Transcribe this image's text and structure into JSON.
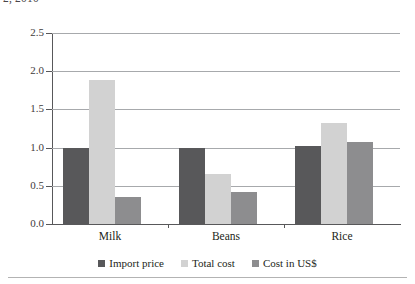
{
  "caption": {
    "text": "2, 2010"
  },
  "chart_data": {
    "type": "bar",
    "title": "",
    "xlabel": "",
    "ylabel": "",
    "ylim": [
      0.0,
      2.5
    ],
    "yticks": [
      "0.0",
      "0.5",
      "1.0",
      "1.5",
      "2.0",
      "2.5"
    ],
    "ytick_values": [
      0.0,
      0.5,
      1.0,
      1.5,
      2.0,
      2.5
    ],
    "grid": true,
    "legend_position": "bottom",
    "categories": [
      "Milk",
      "Beans",
      "Rice"
    ],
    "series": [
      {
        "name": "Import price",
        "color": "#58585a",
        "values": [
          1.0,
          1.0,
          1.02
        ]
      },
      {
        "name": "Total cost",
        "color": "#d2d2d2",
        "values": [
          1.89,
          0.65,
          1.32
        ]
      },
      {
        "name": "Cost in US$",
        "color": "#8d8d8f",
        "values": [
          0.35,
          0.42,
          1.07
        ]
      }
    ]
  },
  "colors": {
    "axis": "#58585a",
    "gridline": "#a7a9ac",
    "text": "#231f20",
    "footer_rule": "#b3b3b3"
  }
}
